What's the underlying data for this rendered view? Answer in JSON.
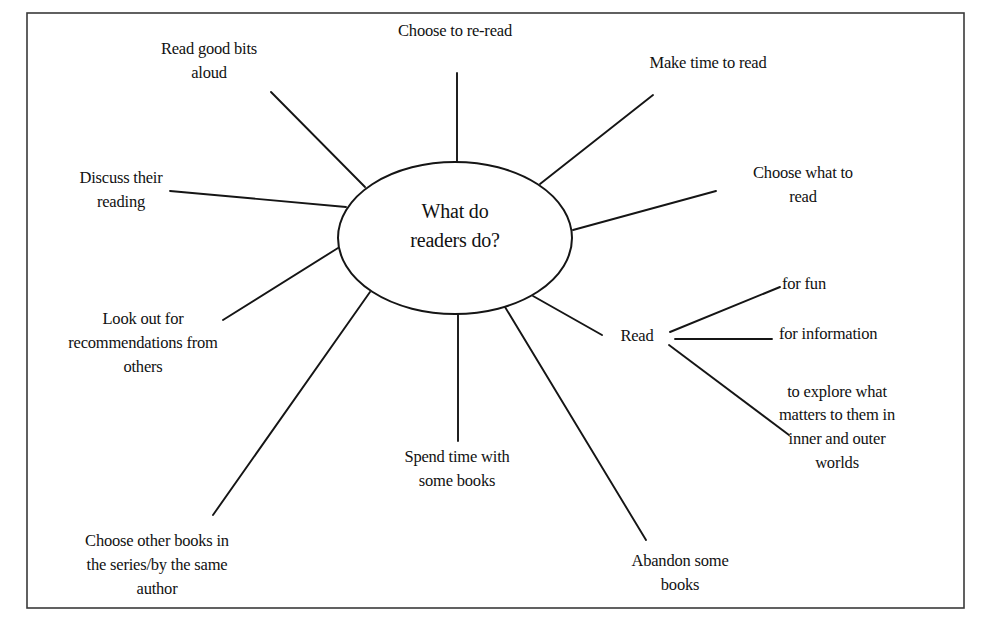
{
  "diagram": {
    "type": "spider-diagram",
    "center": {
      "line1": "What do",
      "line2": "readers do?"
    },
    "nodes": {
      "re_read": {
        "lines": [
          "Choose to re-read"
        ]
      },
      "make_time": {
        "lines": [
          "Make time to read"
        ]
      },
      "choose_what": {
        "lines": [
          "Choose what to",
          "read"
        ]
      },
      "read": {
        "lines": [
          "Read"
        ],
        "children": {
          "for_fun": {
            "lines": [
              "for fun"
            ]
          },
          "for_information": {
            "lines": [
              "for information"
            ]
          },
          "explore": {
            "lines": [
              "to explore what",
              "matters to them in",
              "inner and outer",
              "worlds"
            ]
          }
        }
      },
      "abandon": {
        "lines": [
          "Abandon some",
          "books"
        ]
      },
      "spend_time": {
        "lines": [
          "Spend time with",
          "some books"
        ]
      },
      "other_books": {
        "lines": [
          "Choose other books in",
          "the series/by the same",
          "author"
        ]
      },
      "recommendations": {
        "lines": [
          "Look out for",
          "recommendations from",
          "others"
        ]
      },
      "discuss": {
        "lines": [
          "Discuss their",
          "reading"
        ]
      },
      "read_aloud": {
        "lines": [
          "Read good bits",
          "aloud"
        ]
      }
    }
  }
}
